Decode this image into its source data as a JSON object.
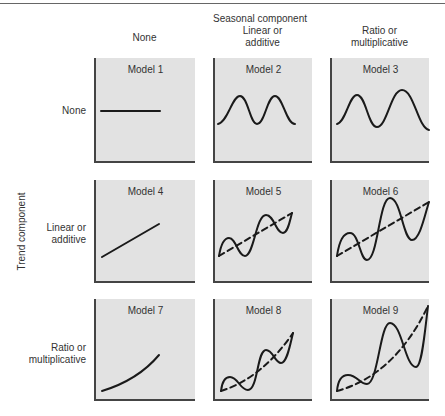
{
  "figure": {
    "column_axis_title": "Seasonal component",
    "row_axis_title": "Trend component",
    "columns": [
      "None",
      "Linear or\nadditive",
      "Ratio or\nmultiplicative"
    ],
    "rows": [
      "None",
      "Linear or\nadditive",
      "Ratio or\nmultiplicative"
    ],
    "models": [
      {
        "title": "Model 1",
        "trend": "None",
        "seasonal": "None",
        "shape": "flat line"
      },
      {
        "title": "Model 2",
        "trend": "None",
        "seasonal": "Linear or additive",
        "shape": "constant-amplitude wave"
      },
      {
        "title": "Model 3",
        "trend": "None",
        "seasonal": "Ratio or multiplicative",
        "shape": "growing-amplitude wave"
      },
      {
        "title": "Model 4",
        "trend": "Linear or additive",
        "seasonal": "None",
        "shape": "straight rising line"
      },
      {
        "title": "Model 5",
        "trend": "Linear or additive",
        "seasonal": "Linear or additive",
        "shape": "constant wave around dashed linear trend"
      },
      {
        "title": "Model 6",
        "trend": "Linear or additive",
        "seasonal": "Ratio or multiplicative",
        "shape": "growing wave around dashed linear trend"
      },
      {
        "title": "Model 7",
        "trend": "Ratio or multiplicative",
        "seasonal": "None",
        "shape": "exponential curve"
      },
      {
        "title": "Model 8",
        "trend": "Ratio or multiplicative",
        "seasonal": "Linear or additive",
        "shape": "constant wave around dashed exponential trend"
      },
      {
        "title": "Model 9",
        "trend": "Ratio or multiplicative",
        "seasonal": "Ratio or multiplicative",
        "shape": "growing wave around dashed exponential trend"
      }
    ]
  },
  "colors": {
    "panel_fill": "#e2e2e2",
    "axis": "#444444",
    "curve": "#1a1a1a",
    "text": "#333333"
  }
}
